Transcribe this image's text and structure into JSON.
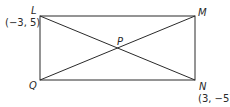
{
  "diagram": {
    "type": "rectangle-with-diagonals",
    "points": {
      "L": {
        "label": "L",
        "coord": "(−3, 5)"
      },
      "M": {
        "label": "M"
      },
      "N": {
        "label": "N",
        "coord": "(3, −5)"
      },
      "Q": {
        "label": "Q"
      },
      "P": {
        "label": "P"
      }
    },
    "stroke_color": "#2a2a2a"
  }
}
